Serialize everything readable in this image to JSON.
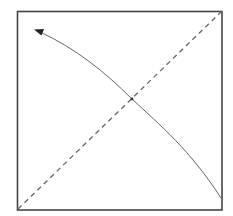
{
  "diagram": {
    "type": "origami-fold-instruction",
    "paper": {
      "shape": "square",
      "x": 17,
      "y": 11,
      "width": 205,
      "height": 199,
      "stroke": "#444444",
      "fill": "#ffffff"
    },
    "fold_line": {
      "style": "dashed",
      "from": [
        18,
        209
      ],
      "to": [
        222,
        11
      ],
      "stroke": "#666666",
      "label": "valley fold diagonal"
    },
    "fold_arrow": {
      "from": [
        221,
        198
      ],
      "through": [
        132,
        99
      ],
      "to": [
        35,
        30
      ],
      "stroke": "#666666",
      "arrowhead_color": "#222222",
      "direction": "bottom-right corner to top-left corner"
    },
    "center_point": [
      132,
      99
    ]
  }
}
